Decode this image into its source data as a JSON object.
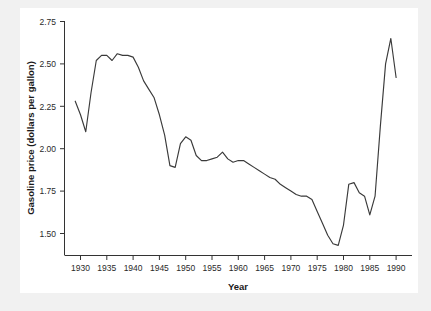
{
  "figure": {
    "background_color": "#f1f1f1",
    "plot_background_color": "#ffffff",
    "line_color": "#3a3a3a",
    "axis_color": "#333333"
  },
  "chart_data": {
    "type": "line",
    "title": "",
    "xlabel": "Year",
    "ylabel": "Gasoline price (dollars per gallon)",
    "xlim": [
      1927,
      1993
    ],
    "ylim": [
      1.38,
      2.78
    ],
    "xticks": [
      1930,
      1935,
      1940,
      1945,
      1950,
      1955,
      1960,
      1965,
      1970,
      1975,
      1980,
      1985,
      1990
    ],
    "yticks": [
      1.5,
      1.75,
      2.0,
      2.25,
      2.5,
      2.75
    ],
    "xtick_labels": [
      "1930",
      "1935",
      "1940",
      "1945",
      "1950",
      "1955",
      "1960",
      "1965",
      "1970",
      "1975",
      "1980",
      "1985",
      "1990"
    ],
    "ytick_labels": [
      "1.50",
      "1.75",
      "2.00",
      "2.25",
      "2.50",
      "2.75"
    ],
    "grid": false,
    "legend": false,
    "legend_position": "none",
    "series": [
      {
        "name": "Gasoline price",
        "x": [
          1929,
          1930,
          1931,
          1932,
          1933,
          1934,
          1935,
          1936,
          1937,
          1938,
          1939,
          1940,
          1941,
          1942,
          1943,
          1944,
          1945,
          1946,
          1947,
          1948,
          1949,
          1950,
          1951,
          1952,
          1953,
          1954,
          1955,
          1956,
          1957,
          1958,
          1959,
          1960,
          1961,
          1962,
          1963,
          1964,
          1965,
          1966,
          1967,
          1968,
          1969,
          1970,
          1971,
          1972,
          1973,
          1974,
          1975,
          1976,
          1977,
          1978,
          1979,
          1980,
          1981,
          1982,
          1983,
          1984,
          1985,
          1986,
          1987,
          1988,
          1989,
          1990
        ],
        "y": [
          2.28,
          2.2,
          2.1,
          2.33,
          2.52,
          2.55,
          2.55,
          2.52,
          2.56,
          2.55,
          2.55,
          2.54,
          2.48,
          2.4,
          2.35,
          2.3,
          2.2,
          2.08,
          1.9,
          1.89,
          2.03,
          2.07,
          2.05,
          1.96,
          1.93,
          1.93,
          1.94,
          1.95,
          1.98,
          1.94,
          1.92,
          1.93,
          1.93,
          1.91,
          1.89,
          1.87,
          1.85,
          1.83,
          1.82,
          1.79,
          1.77,
          1.75,
          1.73,
          1.72,
          1.72,
          1.7,
          1.63,
          1.56,
          1.49,
          1.44,
          1.43,
          1.55,
          1.79,
          1.8,
          1.74,
          1.72,
          1.61,
          1.72,
          2.13,
          2.5,
          2.65,
          2.42
        ]
      }
    ],
    "annotations": []
  }
}
